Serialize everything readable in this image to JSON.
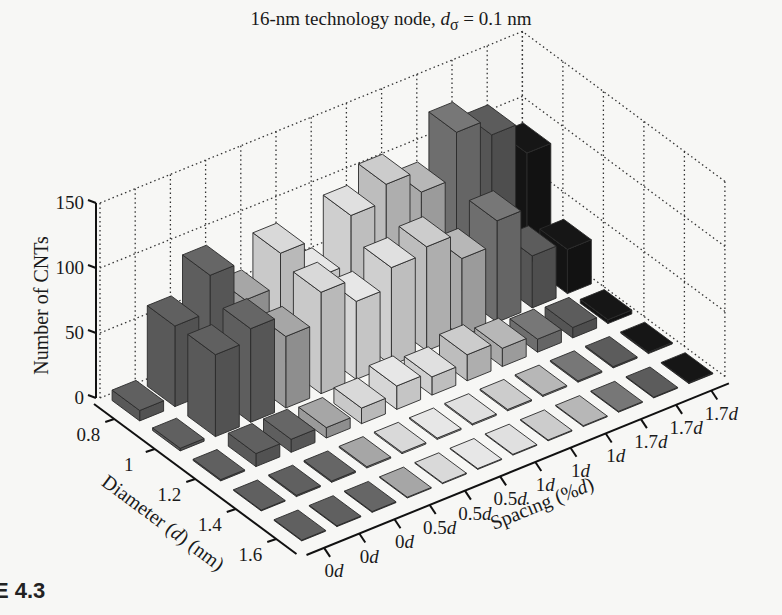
{
  "figure": {
    "caption": "RE 4.3"
  },
  "chart_data": {
    "type": "bar3d",
    "title": "16-nm technology node, dσ = 0.1 nm",
    "title_parts": {
      "prefix": "16-nm technology node, ",
      "var": "d",
      "sub": "σ",
      "suffix": " = 0.1 nm"
    },
    "zlabel": "Number of CNTs",
    "xlabel": "Diameter (d) (nm)",
    "ylabel": "Spacing (%d)",
    "zlim": [
      0,
      150
    ],
    "zticks": [
      0,
      50,
      100,
      150
    ],
    "diameter_ticks": [
      "0.8",
      "1",
      "1.2",
      "1.4",
      "1.6"
    ],
    "spacing_ticks": [
      "0d",
      "0d",
      "0d",
      "0.5d",
      "0.5d",
      "0.5d",
      "1d",
      "1d",
      "1d",
      "1.7d",
      "1.7d",
      "1.7d"
    ],
    "grid": true,
    "series_colors": [
      "#595959",
      "#595959",
      "#5e5e5e",
      "#9a9a9a",
      "#c9c9c9",
      "#d6d6d6",
      "#cfcfcf",
      "#bdbdbd",
      "#a9a9a9",
      "#6e6e6e",
      "#555555",
      "#141414"
    ],
    "values_by_diameter": [
      {
        "diameter": "0.8",
        "values": [
          8,
          62,
          90,
          60,
          85,
          55,
          92,
          105,
          88,
          123,
          110,
          85
        ]
      },
      {
        "diameter": "1",
        "values": [
          2,
          63,
          72,
          55,
          78,
          60,
          75,
          80,
          60,
          78,
          40,
          34
        ]
      },
      {
        "diameter": "1.2",
        "values": [
          1,
          10,
          10,
          8,
          12,
          18,
          14,
          20,
          14,
          10,
          8,
          3
        ]
      },
      {
        "diameter": "1.4",
        "values": [
          0,
          1,
          1,
          1,
          1,
          1,
          1,
          1,
          1,
          1,
          1,
          1
        ]
      },
      {
        "diameter": "1.6",
        "values": [
          0,
          0,
          0,
          0,
          0,
          0,
          0,
          0,
          0,
          0,
          0,
          0
        ]
      }
    ]
  }
}
